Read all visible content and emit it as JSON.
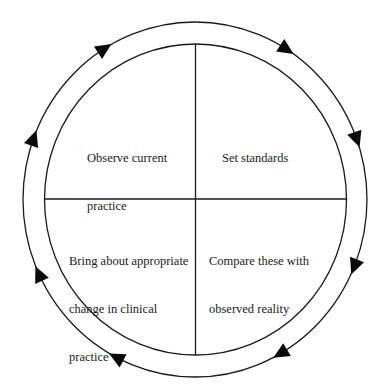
{
  "diagram": {
    "type": "cycle",
    "direction": "clockwise",
    "center": [
      195,
      199
    ],
    "outer_ring": {
      "rx": 172,
      "ry": 177
    },
    "inner_circle": {
      "rx": 151,
      "ry": 155
    },
    "stroke_color": "#1a1a1a",
    "arrow_color": "#0a0a0a",
    "arrow_count": 8,
    "arrow_angles_deg": [
      -122,
      -58,
      -20,
      22,
      60,
      117,
      155,
      200
    ],
    "quadrants": [
      {
        "id": "top-left",
        "lines": [
          "Observe current",
          "practice"
        ],
        "text": "Observe current practice"
      },
      {
        "id": "top-right",
        "lines": [
          "Set standards"
        ],
        "text": "Set standards"
      },
      {
        "id": "bottom-right",
        "lines": [
          "Compare these with",
          "observed reality"
        ],
        "text": "Compare these with observed reality"
      },
      {
        "id": "bottom-left",
        "lines": [
          "Bring about appropriate",
          "change in clinical",
          "practice"
        ],
        "text": "Bring about appropriate change in clinical practice"
      }
    ]
  }
}
